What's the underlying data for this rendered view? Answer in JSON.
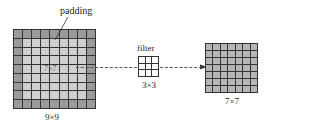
{
  "diagram": {
    "input": {
      "label": "9×9",
      "center_label": "7×7",
      "size": 9,
      "padding": 1
    },
    "padding_label": "padding",
    "filter": {
      "title": "filter",
      "label": "3×3",
      "size": 3
    },
    "output": {
      "label": "7×7",
      "size": 7
    },
    "colors": {
      "padding": "#9a9a9a",
      "inner": "#d0d0d0",
      "output": "#b5b5b5",
      "grid_line": "#333333"
    }
  }
}
